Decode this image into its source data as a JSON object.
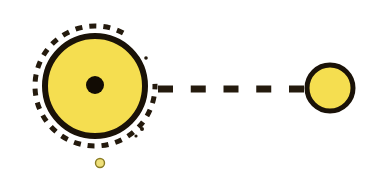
{
  "canvas": {
    "width": 384,
    "height": 179,
    "background_color": "#FFFFFF",
    "title": "Orbital system diagram"
  },
  "palette": {
    "body_fill": "#F5DE50",
    "body_fill_light": "#F7E469",
    "outline": "#1A1208",
    "outline_soft": "#2A2012",
    "small_dot_fill": "#EFE07A",
    "small_dot_outline": "#8A7C24",
    "dash_color": "#241A0D",
    "center_dot": "#120C04"
  },
  "elements": {
    "primary_body": {
      "name": "large-yellow-circle",
      "cx": 95,
      "cy": 86,
      "r": 50,
      "stroke_width": 6,
      "fill": "#F5DE50",
      "stroke": "#1A1208"
    },
    "primary_core": {
      "name": "center-black-dot",
      "cx": 95,
      "cy": 85,
      "r": 9,
      "fill": "#120C04"
    },
    "orbit_arc": {
      "name": "dashed-orbit-arc",
      "cx": 95,
      "cy": 86,
      "r": 60,
      "stroke_width": 5,
      "stroke": "#241A0D",
      "dash_pattern": "7 7",
      "start_angle_deg": -62,
      "sweep_deg": -300,
      "description": "dashed circular arc around primary body, open on right side"
    },
    "orbit_arc_taper": [
      {
        "cx": 146,
        "cy": 58,
        "r": 1.8
      },
      {
        "cx": 142,
        "cy": 129,
        "r": 2.0
      },
      {
        "cx": 136,
        "cy": 136,
        "r": 1.6
      }
    ],
    "connector": {
      "name": "dashed-connector-line",
      "x1": 158,
      "y1": 89,
      "x2": 304,
      "y2": 89,
      "stroke_width": 7,
      "stroke": "#241A0D",
      "dash_pattern": "15 16",
      "dash_count": 5
    },
    "secondary_body": {
      "name": "small-yellow-circle",
      "cx": 330,
      "cy": 88,
      "r": 23,
      "stroke_width": 5,
      "fill": "#F5DE50",
      "stroke": "#1A1208"
    },
    "satellite_dot": {
      "name": "tiny-yellow-dot",
      "cx": 100,
      "cy": 163,
      "r": 4.5,
      "stroke_width": 1.4,
      "fill": "#EFE07A",
      "stroke": "#8A7C24"
    }
  },
  "labels": {
    "primary_body": "Large yellow body with dark core",
    "secondary_body": "Small yellow body",
    "satellite_dot": "Tiny yellow satellite",
    "orbit_arc": "Dashed orbit path",
    "connector": "Dashed link between bodies"
  }
}
